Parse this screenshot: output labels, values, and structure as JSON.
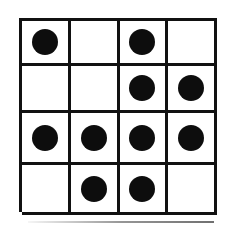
{
  "figure": {
    "rows": 4,
    "columns": 4,
    "cell_shape": "square",
    "mark_glyph": "filled-circle",
    "colors": {
      "background": "#ffffff",
      "grid_line": "#111111",
      "dot_fill": "#0d0d0d"
    }
  },
  "chart_data": {
    "type": "heatmap",
    "subtitle": "",
    "xlabel": "",
    "ylabel": "",
    "categories": [
      "C1",
      "C2",
      "C3",
      "C4"
    ],
    "row_labels": [
      "R1",
      "R2",
      "R3",
      "R4"
    ],
    "grid": true,
    "legend": "none",
    "value_meaning": {
      "1": "filled black dot",
      "0": "empty cell"
    },
    "values": [
      [
        1,
        0,
        1,
        0
      ],
      [
        0,
        0,
        1,
        1
      ],
      [
        1,
        1,
        1,
        1
      ],
      [
        0,
        1,
        1,
        0
      ]
    ],
    "dot_count": 10
  },
  "cells": [
    {
      "name": "cell-r1c1",
      "row": 1,
      "col": 1,
      "filled": true,
      "state": "filled"
    },
    {
      "name": "cell-r1c2",
      "row": 1,
      "col": 2,
      "filled": false,
      "state": "empty"
    },
    {
      "name": "cell-r1c3",
      "row": 1,
      "col": 3,
      "filled": true,
      "state": "filled"
    },
    {
      "name": "cell-r1c4",
      "row": 1,
      "col": 4,
      "filled": false,
      "state": "empty"
    },
    {
      "name": "cell-r2c1",
      "row": 2,
      "col": 1,
      "filled": false,
      "state": "empty"
    },
    {
      "name": "cell-r2c2",
      "row": 2,
      "col": 2,
      "filled": false,
      "state": "empty"
    },
    {
      "name": "cell-r2c3",
      "row": 2,
      "col": 3,
      "filled": true,
      "state": "filled"
    },
    {
      "name": "cell-r2c4",
      "row": 2,
      "col": 4,
      "filled": true,
      "state": "filled"
    },
    {
      "name": "cell-r3c1",
      "row": 3,
      "col": 1,
      "filled": true,
      "state": "filled"
    },
    {
      "name": "cell-r3c2",
      "row": 3,
      "col": 2,
      "filled": true,
      "state": "filled"
    },
    {
      "name": "cell-r3c3",
      "row": 3,
      "col": 3,
      "filled": true,
      "state": "filled"
    },
    {
      "name": "cell-r3c4",
      "row": 3,
      "col": 4,
      "filled": true,
      "state": "filled"
    },
    {
      "name": "cell-r4c1",
      "row": 4,
      "col": 1,
      "filled": false,
      "state": "empty"
    },
    {
      "name": "cell-r4c2",
      "row": 4,
      "col": 2,
      "filled": true,
      "state": "filled"
    },
    {
      "name": "cell-r4c3",
      "row": 4,
      "col": 3,
      "filled": true,
      "state": "filled"
    },
    {
      "name": "cell-r4c4",
      "row": 4,
      "col": 4,
      "filled": false,
      "state": "empty"
    }
  ]
}
